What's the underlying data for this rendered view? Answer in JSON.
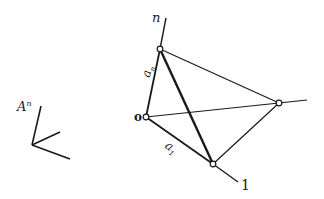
{
  "diagram": {
    "frame_label": {
      "base": "A",
      "superscript": "n"
    },
    "labels": {
      "origin": "o",
      "axis_n": "n",
      "axis_1": "1",
      "edge_an": {
        "base": "a",
        "subscript": "n"
      },
      "edge_a1": {
        "base": "a",
        "subscript": "1"
      }
    },
    "points": {
      "origin": [
        146,
        117
      ],
      "top": [
        160,
        49
      ],
      "bottom": [
        213,
        164
      ],
      "right": [
        279,
        103
      ]
    },
    "axes_ends": {
      "n": [
        166,
        18
      ],
      "one": [
        238,
        182
      ],
      "right": [
        307,
        100
      ]
    },
    "small_frame": {
      "origin": [
        32,
        145
      ],
      "ends": [
        [
          41,
          106
        ],
        [
          60,
          132
        ],
        [
          70,
          159
        ]
      ]
    },
    "colors": {
      "stroke": "#1a1a1a",
      "background": "#ffffff"
    }
  }
}
